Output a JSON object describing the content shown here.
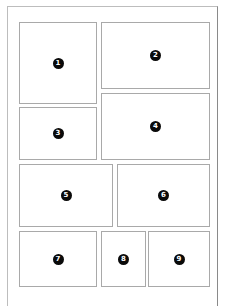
{
  "layout": {
    "type": "comic-page-panel-layout",
    "panel_count": 9,
    "border_color": "#a9a9a9",
    "badge_color": "#0a0a0a",
    "badge_text_color": "#ffffff"
  },
  "panels": [
    {
      "id": 1,
      "label": "1",
      "x": 19,
      "y": 22,
      "w": 78,
      "h": 82
    },
    {
      "id": 2,
      "label": "2",
      "x": 101,
      "y": 22,
      "w": 109,
      "h": 67
    },
    {
      "id": 3,
      "label": "3",
      "x": 19,
      "y": 107,
      "w": 78,
      "h": 53
    },
    {
      "id": 4,
      "label": "4",
      "x": 101,
      "y": 93,
      "w": 109,
      "h": 67
    },
    {
      "id": 5,
      "label": "5",
      "x": 19,
      "y": 164,
      "w": 94,
      "h": 63
    },
    {
      "id": 6,
      "label": "6",
      "x": 117,
      "y": 164,
      "w": 93,
      "h": 63
    },
    {
      "id": 7,
      "label": "7",
      "x": 19,
      "y": 231,
      "w": 78,
      "h": 56
    },
    {
      "id": 8,
      "label": "8",
      "x": 101,
      "y": 231,
      "w": 45,
      "h": 56
    },
    {
      "id": 9,
      "label": "9",
      "x": 148,
      "y": 231,
      "w": 62,
      "h": 56
    }
  ]
}
